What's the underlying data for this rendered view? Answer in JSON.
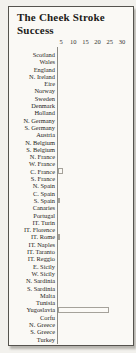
{
  "title": {
    "line1": "The Cheek Stroke",
    "line2": "Success"
  },
  "chart_data": {
    "type": "bar",
    "orientation": "horizontal",
    "title": "The Cheek Stroke Success",
    "categories": [
      "Scotland",
      "Wales",
      "England",
      "N. Ireland",
      "Eire",
      "Norway",
      "Sweden",
      "Denmark",
      "Holland",
      "N. Germany",
      "S. Germany",
      "Austria",
      "N. Belgium",
      "S. Belgium",
      "N. France",
      "W. France",
      "C. France",
      "S. France",
      "N. Spain",
      "C. Spain",
      "S. Spain",
      "Canaries",
      "Portugal",
      "IT. Turin",
      "IT. Florence",
      "IT. Rome",
      "IT. Naples",
      "IT. Taranto",
      "IT. Reggio",
      "E. Sicily",
      "W. Sicily",
      "N. Sardinia",
      "S. Sardinia",
      "Malta",
      "Tunisia",
      "Yugoslavia",
      "Corfu",
      "N. Greece",
      "S. Greece",
      "Turkey"
    ],
    "values": [
      0,
      0,
      0,
      0,
      0,
      0,
      0,
      0,
      0,
      0,
      0,
      0,
      0,
      0,
      0,
      0,
      2,
      0,
      0,
      0,
      1,
      0,
      0,
      0,
      0,
      1,
      0,
      0,
      0,
      0,
      0,
      0,
      0,
      0,
      0,
      21,
      0,
      0,
      0,
      0
    ],
    "x_ticks": [
      5,
      10,
      15,
      20,
      25,
      30
    ],
    "xlim": [
      0,
      31
    ],
    "xlabel": "",
    "ylabel": "",
    "grid": false,
    "legend": false
  }
}
